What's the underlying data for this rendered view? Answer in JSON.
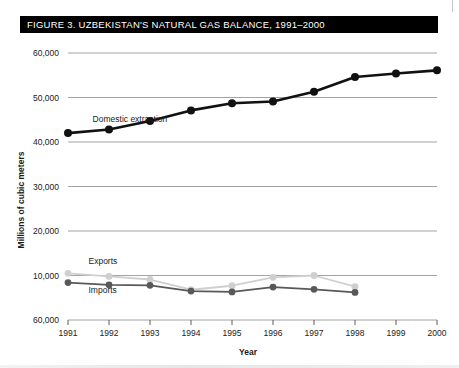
{
  "figure": {
    "title": "FIGURE 3. UZBEKISTAN'S NATURAL GAS BALANCE, 1991–2000"
  },
  "chart_data": {
    "type": "line",
    "title": "FIGURE 3. UZBEKISTAN'S NATURAL GAS BALANCE, 1991–2000",
    "xlabel": "Year",
    "ylabel": "Millions of cubic meters",
    "x": [
      1991,
      1992,
      1993,
      1994,
      1995,
      1996,
      1997,
      1998,
      1999,
      2000
    ],
    "categories": [
      "1991",
      "1992",
      "1993",
      "1994",
      "1995",
      "1996",
      "1997",
      "1998",
      "1999",
      "2000"
    ],
    "ylim": [
      0,
      60000
    ],
    "ytick_values": [
      60000,
      50000,
      40000,
      30000,
      20000,
      10000,
      0
    ],
    "ytick_labels": [
      "60,000",
      "50,000",
      "40,000",
      "30,000",
      "20,000",
      "10,000",
      "60,000"
    ],
    "grid": true,
    "legend": "inline-annotations",
    "series": [
      {
        "name": "Domestic extraction",
        "color": "#111111",
        "marker": "circle",
        "values": [
          42000,
          42800,
          44700,
          47100,
          48700,
          49100,
          51300,
          54600,
          55400,
          56100
        ]
      },
      {
        "name": "Exports",
        "color": "#cfcfcf",
        "marker": "circle",
        "values": [
          10500,
          9800,
          9100,
          6800,
          7700,
          9600,
          10000,
          7500,
          null,
          null
        ]
      },
      {
        "name": "Imports",
        "color": "#595959",
        "marker": "circle",
        "values": [
          8400,
          7900,
          7800,
          6500,
          6300,
          7400,
          6900,
          6200,
          null,
          null
        ]
      }
    ],
    "annotations": [
      {
        "text": "Domestic extraction",
        "x": 1991.6,
        "y": 44500
      },
      {
        "text": "Exports",
        "x": 1991.5,
        "y": 12600
      },
      {
        "text": "Imports",
        "x": 1991.5,
        "y": 6000
      }
    ]
  }
}
